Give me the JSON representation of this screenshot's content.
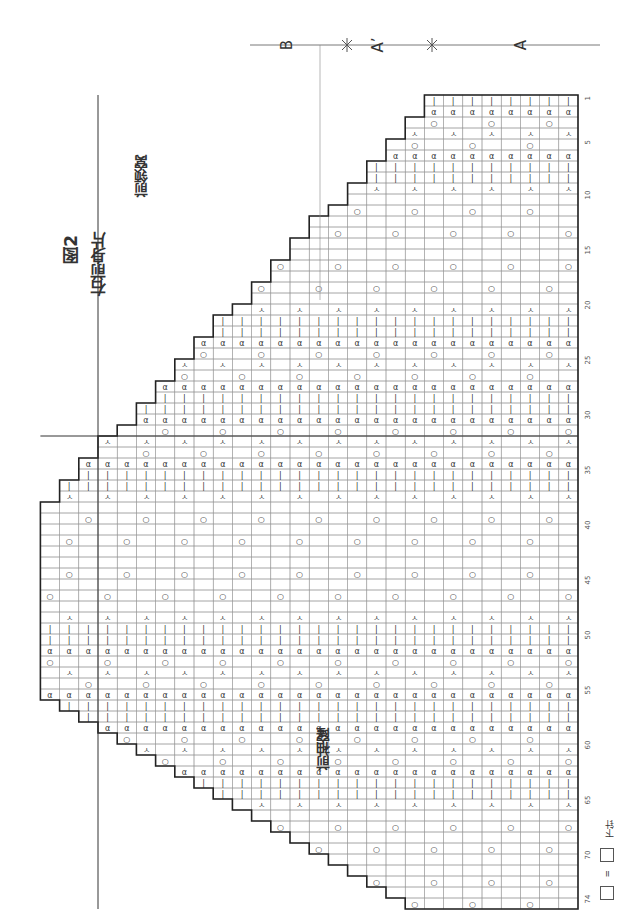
{
  "figure": {
    "title": "图2",
    "subtitle": "右前身片",
    "neck_label": "前领窝",
    "armhole_label": "前袖窿"
  },
  "sections": [
    {
      "id": "A",
      "label": "A"
    },
    {
      "id": "A_prime",
      "label": "A’"
    },
    {
      "id": "B",
      "label": "B"
    }
  ],
  "legend": {
    "symbol": "□",
    "equals": "=",
    "equivalent_symbol": "⊟",
    "meaning": "下针"
  },
  "grid": {
    "columns": 28,
    "rows": 74,
    "row_ticks": [
      "1",
      "5",
      "10",
      "15",
      "20",
      "25",
      "30",
      "35",
      "40",
      "45",
      "50",
      "55",
      "60",
      "65",
      "70",
      "74"
    ]
  },
  "stitch_symbols": {
    "knit": "|",
    "yarn_over": "○",
    "decrease": "ㅅ",
    "twist": "ɑ"
  }
}
